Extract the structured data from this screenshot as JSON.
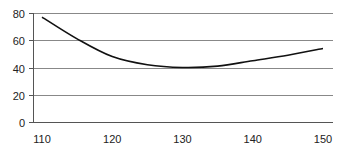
{
  "chart_data": {
    "type": "line",
    "title": "",
    "xlabel": "",
    "ylabel": "",
    "x": [
      110,
      115,
      120,
      125,
      130,
      135,
      140,
      145,
      150
    ],
    "series": [
      {
        "name": "series-1",
        "values": [
          77,
          61,
          48,
          42,
          40,
          41,
          45,
          49,
          54
        ],
        "color": "#111111"
      }
    ],
    "xticks": [
      110,
      120,
      130,
      140,
      150
    ],
    "yticks": [
      0,
      20,
      40,
      60,
      80
    ],
    "xlim": [
      110,
      150
    ],
    "ylim": [
      0,
      80
    ],
    "grid": {
      "horizontal": true,
      "vertical": false,
      "color": "#888888"
    },
    "legend": "none"
  }
}
